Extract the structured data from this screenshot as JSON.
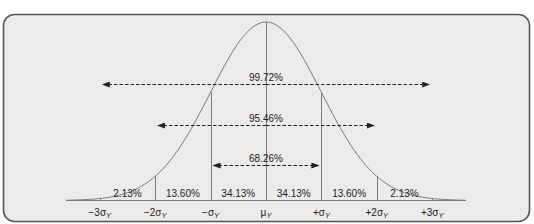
{
  "chart_data": {
    "type": "area",
    "title": "",
    "xlabel": "",
    "ylabel": "",
    "x_ticks": [
      "−3σ",
      "−2σ",
      "−σ",
      "μ",
      "+σ",
      "+2σ",
      "+3σ"
    ],
    "x_tick_subscript": "Y",
    "x_tick_values": [
      -3,
      -2,
      -1,
      0,
      1,
      2,
      3
    ],
    "band_percentages": [
      {
        "from": -3,
        "to": -2,
        "label": "2.13%"
      },
      {
        "from": -2,
        "to": -1,
        "label": "13.60%"
      },
      {
        "from": -1,
        "to": 0,
        "label": "34.13%"
      },
      {
        "from": 0,
        "to": 1,
        "label": "34.13%"
      },
      {
        "from": 1,
        "to": 2,
        "label": "13.60%"
      },
      {
        "from": 2,
        "to": 3,
        "label": "2.13%"
      }
    ],
    "intervals": [
      {
        "range": [
          -3,
          3
        ],
        "label": "99.72%"
      },
      {
        "range": [
          -2,
          2
        ],
        "label": "95.46%"
      },
      {
        "range": [
          -1,
          1
        ],
        "label": "68.26%"
      }
    ],
    "grid": false,
    "legend": null
  },
  "colors": {
    "panel_fill": "#ebebeb",
    "panel_border": "#555555",
    "curve": "#7a7a7a",
    "lines": "#7a7a7a",
    "text": "#222222"
  }
}
